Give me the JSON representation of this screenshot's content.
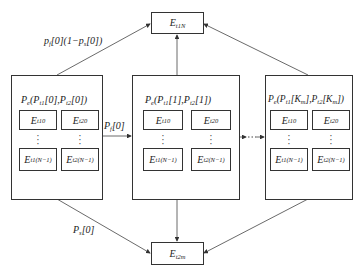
{
  "top_node": {
    "base": "E",
    "sub": "t1N"
  },
  "bottom_node": {
    "base": "E",
    "sub": "t2m"
  },
  "edge_labels": {
    "top_left": "p_f[0](1−p_s[0])",
    "middle_left": "P_f[0]",
    "bottom_left": "P_s[0]"
  },
  "states": [
    {
      "title": "P_e(P_t1[0],P_t2[0])",
      "cells": [
        {
          "base": "E",
          "sub": "t10"
        },
        {
          "base": "E",
          "sub": "t20"
        },
        {
          "base": "E",
          "sub": "t1(N−1)"
        },
        {
          "base": "E",
          "sub": "t2(N−1)"
        }
      ]
    },
    {
      "title": "P_e(P_t1[1],P_t2[1])",
      "cells": [
        {
          "base": "E",
          "sub": "t10"
        },
        {
          "base": "E",
          "sub": "t20"
        },
        {
          "base": "E",
          "sub": "t1(N−1)"
        },
        {
          "base": "E",
          "sub": "t2(N−1)"
        }
      ]
    },
    {
      "title": "P_e(P_t1[K_m],P_t2[K_m])",
      "cells": [
        {
          "base": "E",
          "sub": "t10"
        },
        {
          "base": "E",
          "sub": "t20"
        },
        {
          "base": "E",
          "sub": "t1(N−1)"
        },
        {
          "base": "E",
          "sub": "t2(N−1)"
        }
      ]
    }
  ],
  "ellipsis": "⋮"
}
